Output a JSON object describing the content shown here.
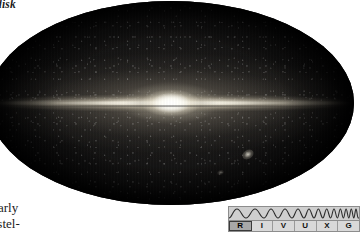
{
  "figure": {
    "type": "all-sky-infrared-map",
    "projection": "mollweide-ellipse"
  },
  "caption_fragments": {
    "top_left": "disk",
    "bottom_left_line1": "arly",
    "bottom_left_line2": "rstel-"
  },
  "sky_features": {
    "galactic_plane_label": "galactic-plane",
    "galactic_bulge_label": "galactic-bulge",
    "large_magellanic_cloud_label": "large-magellanic-cloud",
    "small_magellanic_cloud_label": "small-magellanic-cloud"
  },
  "spectrum_indicator": {
    "name": "RIVUXG",
    "active_band": "R",
    "bands": [
      {
        "letter": "R",
        "band": "Radio",
        "active": true
      },
      {
        "letter": "I",
        "band": "Infrared",
        "active": false
      },
      {
        "letter": "V",
        "band": "Visible",
        "active": false
      },
      {
        "letter": "U",
        "band": "Ultraviolet",
        "active": false
      },
      {
        "letter": "X",
        "band": "X-ray",
        "active": false
      },
      {
        "letter": "G",
        "band": "Gamma ray",
        "active": false
      }
    ]
  },
  "colors": {
    "sky_background": "#050506",
    "plane_highlight": "#fffcf3",
    "page_background": "#ffffff",
    "indicator_fill": "#d9d9d9",
    "indicator_border": "#8d8d8d",
    "indicator_active": "#a8a8a8"
  }
}
